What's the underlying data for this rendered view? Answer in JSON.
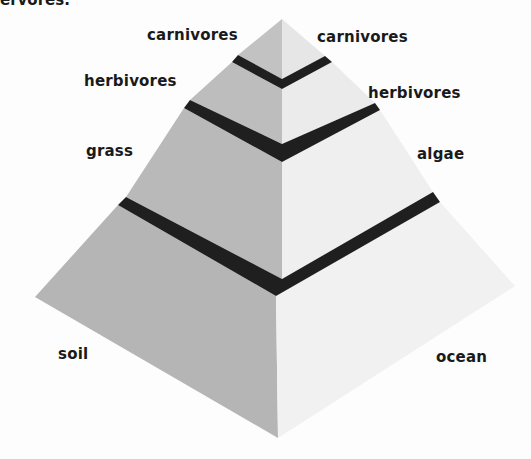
{
  "caption_fragment": "ervores.",
  "diagram": {
    "left_side": {
      "name": "land",
      "levels": [
        {
          "label": "carnivores"
        },
        {
          "label": "herbivores"
        },
        {
          "label": "grass"
        },
        {
          "label": "soil"
        }
      ]
    },
    "right_side": {
      "name": "ocean",
      "levels": [
        {
          "label": "carnivores"
        },
        {
          "label": "herbivores"
        },
        {
          "label": "algae"
        },
        {
          "label": "ocean"
        }
      ]
    },
    "colors": {
      "left_face": "#b9b9b9",
      "right_face": "#ececec",
      "band": "#1f1f1f",
      "background": "#fdfdfd"
    }
  }
}
